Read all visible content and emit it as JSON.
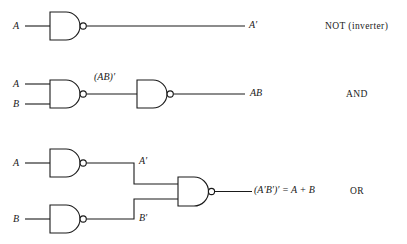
{
  "figure": {
    "stroke_color": "#1a1a1a",
    "background_color": "#ffffff"
  },
  "rows": [
    {
      "id": "not",
      "name": "NOT (inverter)",
      "name_main": "NOT",
      "name_paren": "(inverter)",
      "inputs": [
        {
          "label": "A",
          "name": "input-label-a"
        }
      ],
      "gates": [
        {
          "type": "nand",
          "name": "nand-gate-1"
        }
      ],
      "output": {
        "label": "A′",
        "name": "output-label-a-prime"
      },
      "intermediate": []
    },
    {
      "id": "and",
      "name": "AND",
      "name_main": "AND",
      "name_paren": "",
      "inputs": [
        {
          "label": "A",
          "name": "input-label-a"
        },
        {
          "label": "B",
          "name": "input-label-b"
        }
      ],
      "gates": [
        {
          "type": "nand",
          "name": "nand-gate-1"
        },
        {
          "type": "nand",
          "name": "nand-gate-2"
        }
      ],
      "output": {
        "label": "AB",
        "name": "output-label-ab"
      },
      "intermediate": [
        {
          "label": "(AB)′",
          "name": "wire-label-ab-prime"
        }
      ]
    },
    {
      "id": "or",
      "name": "OR",
      "name_main": "OR",
      "name_paren": "",
      "inputs": [
        {
          "label": "A",
          "name": "input-label-a"
        },
        {
          "label": "B",
          "name": "input-label-b"
        }
      ],
      "gates": [
        {
          "type": "nand",
          "name": "nand-gate-1"
        },
        {
          "type": "nand",
          "name": "nand-gate-2"
        },
        {
          "type": "nand",
          "name": "nand-gate-3"
        }
      ],
      "output": {
        "label": "(A′B′)′ = A + B",
        "name": "output-label-or"
      },
      "intermediate": [
        {
          "label": "A′",
          "name": "wire-label-a-prime"
        },
        {
          "label": "B′",
          "name": "wire-label-b-prime"
        }
      ]
    }
  ]
}
